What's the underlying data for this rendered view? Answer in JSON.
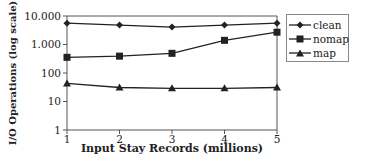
{
  "chart_data": {
    "type": "line",
    "title": "",
    "xlabel": "Input Stay Records (millions)",
    "ylabel": "I/O Operations (log scale)",
    "yscale": "log",
    "ylim": [
      1,
      10000
    ],
    "xlim": [
      1,
      5
    ],
    "x": [
      1,
      2,
      3,
      4,
      5
    ],
    "x_tick_labels": [
      "1",
      "2",
      "3",
      "4",
      "5"
    ],
    "y_tick_labels": [
      "1",
      "10",
      "100",
      "1.000",
      "10.000"
    ],
    "y_tick_values": [
      1,
      10,
      100,
      1000,
      10000
    ],
    "grid": false,
    "legend_position": "right",
    "series": [
      {
        "name": "clean",
        "marker": "diamond",
        "values": [
          5600,
          4800,
          4100,
          4800,
          5600
        ]
      },
      {
        "name": "nomap",
        "marker": "square",
        "values": [
          355,
          390,
          490,
          1400,
          2700
        ]
      },
      {
        "name": "map",
        "marker": "triangle",
        "values": [
          43,
          31,
          29,
          29,
          31
        ]
      }
    ]
  },
  "colors": {
    "line": "#222222",
    "axis": "#555555",
    "legend_border": "#888888"
  }
}
